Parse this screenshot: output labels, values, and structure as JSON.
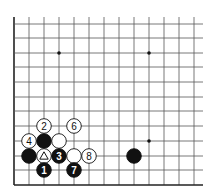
{
  "board": {
    "columns_x": [
      14,
      29,
      44,
      59,
      74,
      89,
      104,
      119,
      134,
      149,
      164,
      179,
      194
    ],
    "rows_y": [
      185,
      170,
      156,
      141,
      126,
      111,
      97,
      82,
      67,
      53,
      38,
      24
    ],
    "right_extent": 203,
    "top_extent": 17,
    "line_color": "#555555",
    "edge_color": "#222222",
    "star_points": [
      {
        "col": 3,
        "row": 9
      },
      {
        "col": 9,
        "row": 9
      },
      {
        "col": 9,
        "row": 3
      }
    ],
    "stone_radius": 7.3
  },
  "stones": [
    {
      "color": "black",
      "col": 1,
      "row": 2,
      "label": ""
    },
    {
      "color": "black",
      "col": 2,
      "row": 3,
      "label": ""
    },
    {
      "color": "white",
      "col": 3,
      "row": 3,
      "label": ""
    },
    {
      "color": "white",
      "col": 2,
      "row": 4,
      "label": "2"
    },
    {
      "color": "white",
      "col": 4,
      "row": 4,
      "label": "6"
    },
    {
      "color": "white",
      "col": 1,
      "row": 3,
      "label": "4"
    },
    {
      "color": "white",
      "col": 2,
      "row": 2,
      "label": "",
      "marker": "triangle"
    },
    {
      "color": "black",
      "col": 3,
      "row": 2,
      "label": "3"
    },
    {
      "color": "white",
      "col": 4,
      "row": 2,
      "label": ""
    },
    {
      "color": "white",
      "col": 5,
      "row": 2,
      "label": "8"
    },
    {
      "color": "black",
      "col": 2,
      "row": 1,
      "label": "1"
    },
    {
      "color": "black",
      "col": 4,
      "row": 1,
      "label": "7"
    },
    {
      "color": "black",
      "col": 8,
      "row": 2,
      "label": ""
    }
  ]
}
